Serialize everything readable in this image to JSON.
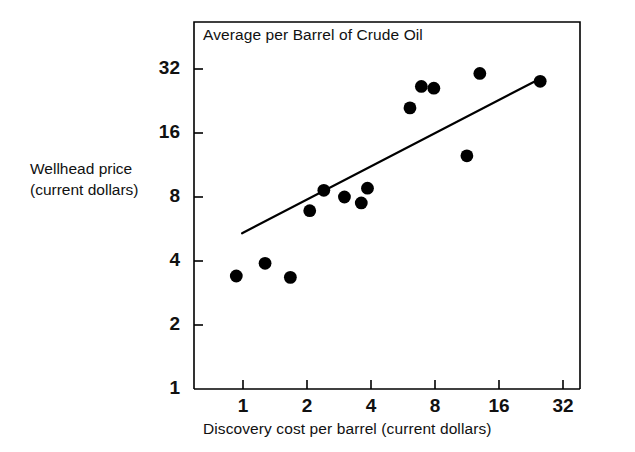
{
  "chart_data": {
    "type": "scatter",
    "title": "Average per Barrel of Crude Oil",
    "xlabel": "Discovery cost per barrel (current dollars)",
    "ylabel_line1": "Wellhead price",
    "ylabel_line2": "(current dollars)",
    "xscale": "log2",
    "yscale": "log2",
    "xlim": [
      0.72,
      38
    ],
    "ylim": [
      1,
      45
    ],
    "xticks": [
      1,
      2,
      4,
      8,
      16,
      32
    ],
    "xtick_labels": [
      "1",
      "2",
      "4",
      "8",
      "16",
      "32"
    ],
    "yticks": [
      1,
      2,
      4,
      8,
      16,
      32
    ],
    "ytick_labels": [
      "1",
      "2",
      "4",
      "8",
      "16",
      "32"
    ],
    "grid": false,
    "legend": "none",
    "marker": "filled-circle",
    "marker_color": "#000000",
    "line_color": "#000000",
    "frame_color": "#000000",
    "points": [
      {
        "x": 0.93,
        "y": 3.4
      },
      {
        "x": 1.27,
        "y": 3.9
      },
      {
        "x": 1.67,
        "y": 3.35
      },
      {
        "x": 2.06,
        "y": 6.9
      },
      {
        "x": 2.4,
        "y": 8.6
      },
      {
        "x": 3.0,
        "y": 8.0
      },
      {
        "x": 3.6,
        "y": 7.5
      },
      {
        "x": 3.85,
        "y": 8.8
      },
      {
        "x": 6.1,
        "y": 21.0
      },
      {
        "x": 6.9,
        "y": 26.5
      },
      {
        "x": 7.9,
        "y": 26.0
      },
      {
        "x": 11.3,
        "y": 12.5
      },
      {
        "x": 13.0,
        "y": 30.5
      },
      {
        "x": 25.0,
        "y": 28.0
      }
    ],
    "fit_line": {
      "x_start": 0.99,
      "y_start": 5.4,
      "x_end": 25.6,
      "y_end": 29.2
    }
  }
}
